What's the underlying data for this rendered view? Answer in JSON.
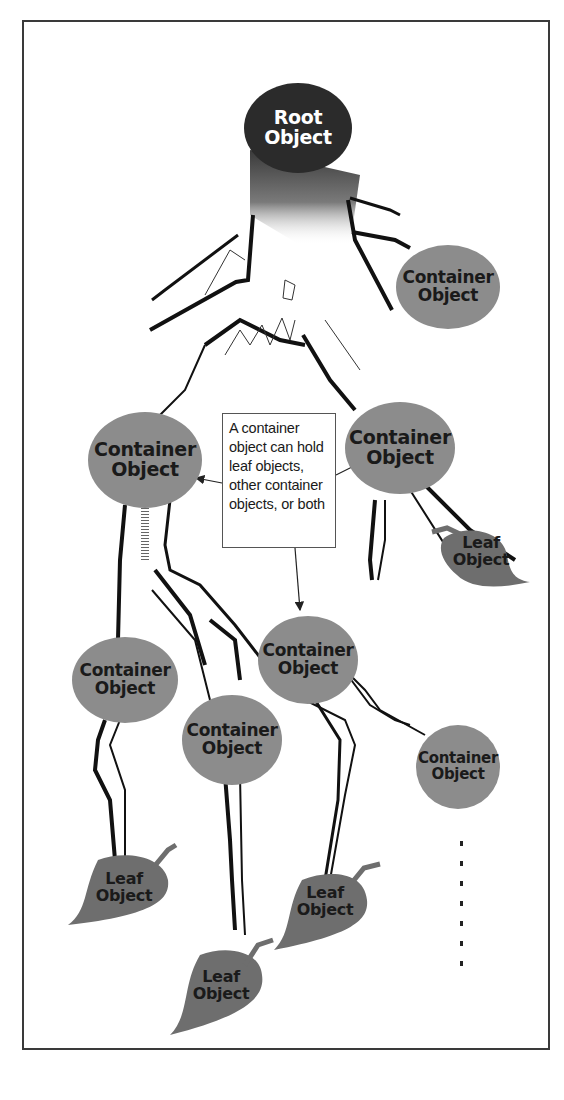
{
  "diagram": {
    "title": "",
    "colors": {
      "root_fill": "#2b2b2b",
      "container_fill": "#8c8c8c",
      "leaf_fill": "#6e6e6e",
      "branch_stroke": "#111111",
      "frame_border": "#3a3a3a"
    },
    "root": {
      "line1": "Root",
      "line2": "Object"
    },
    "containers": [
      {
        "id": "c-top-right",
        "line1": "Container",
        "line2": "Object"
      },
      {
        "id": "c-mid-left",
        "line1": "Container",
        "line2": "Object"
      },
      {
        "id": "c-mid-right",
        "line1": "Container",
        "line2": "Object"
      },
      {
        "id": "c-low-center",
        "line1": "Container",
        "line2": "Object"
      },
      {
        "id": "c-low-left",
        "line1": "Container",
        "line2": "Object"
      },
      {
        "id": "c-low-mid",
        "line1": "Container",
        "line2": "Object"
      },
      {
        "id": "c-low-right",
        "line1": "Container",
        "line2": "Object"
      }
    ],
    "leaves": [
      {
        "id": "leaf-right",
        "line1": "Leaf",
        "line2": "Object"
      },
      {
        "id": "leaf-bottom-left",
        "line1": "Leaf",
        "line2": "Object"
      },
      {
        "id": "leaf-bottom-center",
        "line1": "Leaf",
        "line2": "Object"
      },
      {
        "id": "leaf-bottom-mid",
        "line1": "Leaf",
        "line2": "Object"
      }
    ],
    "callout": {
      "lines": [
        "A container",
        "object can hold",
        "leaf objects,",
        "other container",
        "objects, or both"
      ]
    },
    "continuation": "ellipsis-vertical"
  }
}
